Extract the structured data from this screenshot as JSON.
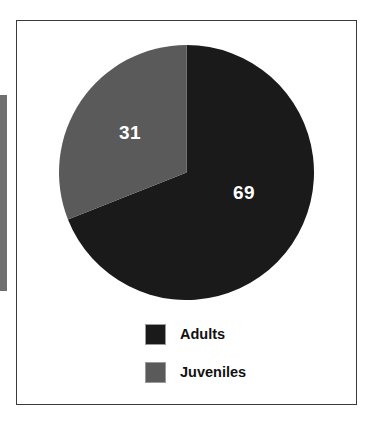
{
  "figure": {
    "frame_border_color": "#3a3a3a",
    "background_color": "#ffffff"
  },
  "artifact": {
    "name": "left-edge-scan-bar",
    "color": "#6f6f6f"
  },
  "chart_data": {
    "type": "pie",
    "title": "",
    "subtitle": "",
    "xlabel": "",
    "ylabel": "",
    "categories": [
      "Adults",
      "Juveniles"
    ],
    "values": [
      69,
      31
    ],
    "unit": "%",
    "colors": [
      "#1a1a1a",
      "#5a5a5a"
    ],
    "label_color": "#ffffff",
    "start_angle_deg": 0,
    "direction": "clockwise",
    "grid": false,
    "legend_position": "bottom",
    "slices": [
      {
        "name": "Adults",
        "value": 69,
        "label": "69",
        "color": "#1a1a1a",
        "start_deg": 0,
        "end_deg": 248.4
      },
      {
        "name": "Juveniles",
        "value": 31,
        "label": "31",
        "color": "#5a5a5a",
        "start_deg": 248.4,
        "end_deg": 360
      }
    ],
    "legend": [
      {
        "label": "Adults",
        "color": "#1a1a1a"
      },
      {
        "label": "Juveniles",
        "color": "#5a5a5a"
      }
    ]
  }
}
